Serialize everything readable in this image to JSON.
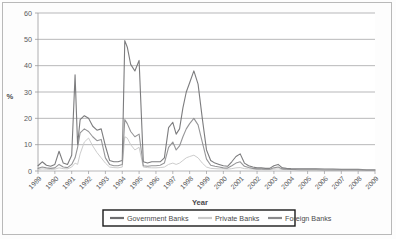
{
  "figure": {
    "kind": "line-chart-image",
    "background": "#fdfdfd",
    "frame_color": "#b9b9b9"
  },
  "axes": {
    "y_label": "%",
    "x_label": "Year",
    "y_ticks": [
      "0",
      "10",
      "20",
      "30",
      "40",
      "50",
      "60"
    ],
    "x_ticks": [
      "1989",
      "1990",
      "1991",
      "1992",
      "1993",
      "1994",
      "1995",
      "1996",
      "1997",
      "1998",
      "1999",
      "2000",
      "2001",
      "2002",
      "2003",
      "2004",
      "2005",
      "2006",
      "2007",
      "2008",
      "2009"
    ]
  },
  "legend": {
    "items": [
      {
        "label": "Government Banks",
        "color": "#6e6e70"
      },
      {
        "label": "Private Banks",
        "color": "#c9c9c9"
      },
      {
        "label": "Foreign Banks",
        "color": "#8a8a8c"
      }
    ],
    "border_color": "#1a1a1a",
    "position": "bottom-center"
  },
  "chart_data": {
    "type": "line",
    "title": "",
    "subtitle": "",
    "xlabel": "Year",
    "ylabel": "%",
    "xlim": [
      1989,
      2009
    ],
    "ylim": [
      0,
      60
    ],
    "grid": "horizontal",
    "legend_position": "bottom-center",
    "x": [
      1989,
      1989.25,
      1989.5,
      1989.75,
      1990,
      1990.25,
      1990.5,
      1990.75,
      1991,
      1991.2,
      1991.35,
      1991.5,
      1991.75,
      1992,
      1992.25,
      1992.5,
      1992.75,
      1993,
      1993.25,
      1993.5,
      1993.75,
      1994,
      1994.15,
      1994.3,
      1994.5,
      1994.75,
      1995,
      1995.25,
      1995.5,
      1995.75,
      1996,
      1996.25,
      1996.5,
      1996.75,
      1997,
      1997.2,
      1997.4,
      1997.6,
      1997.8,
      1998,
      1998.25,
      1998.5,
      1998.75,
      1999,
      1999.25,
      1999.5,
      1999.75,
      2000,
      2000.25,
      2000.5,
      2000.75,
      2001,
      2001.25,
      2001.5,
      2001.75,
      2002,
      2002.25,
      2002.5,
      2002.75,
      2003,
      2003.25,
      2003.5,
      2003.75,
      2004,
      2004.5,
      2005,
      2005.5,
      2006,
      2006.5,
      2007,
      2007.5,
      2008,
      2008.5,
      2009
    ],
    "series": [
      {
        "name": "Government Banks",
        "color": "#6e6e70",
        "values": [
          2.0,
          3.5,
          2.2,
          1.8,
          2.5,
          7.5,
          3.0,
          2.5,
          6.0,
          36.5,
          10.0,
          19.5,
          21.0,
          20.0,
          17.0,
          15.5,
          16.0,
          9.5,
          4.0,
          3.5,
          3.5,
          4.0,
          49.5,
          47.0,
          40.5,
          38.0,
          42.0,
          3.5,
          3.0,
          3.5,
          3.5,
          3.5,
          5.0,
          16.5,
          18.5,
          14.0,
          16.0,
          24.0,
          30.0,
          33.5,
          38.0,
          33.0,
          20.0,
          8.0,
          4.0,
          3.0,
          2.5,
          2.0,
          1.8,
          3.5,
          5.5,
          6.5,
          3.0,
          2.0,
          1.5,
          1.2,
          1.2,
          1.0,
          1.0,
          2.0,
          2.5,
          1.2,
          1.0,
          0.9,
          0.8,
          0.8,
          0.8,
          0.7,
          0.7,
          0.6,
          0.6,
          0.6,
          0.5,
          0.5
        ]
      },
      {
        "name": "Private Banks",
        "color": "#c9c9c9",
        "values": [
          0.6,
          0.8,
          0.7,
          0.6,
          0.7,
          1.2,
          0.9,
          0.8,
          1.5,
          3.0,
          2.5,
          6.5,
          11.0,
          12.5,
          9.5,
          7.0,
          5.0,
          3.0,
          1.5,
          1.3,
          1.2,
          1.5,
          13.0,
          12.5,
          10.0,
          8.0,
          9.0,
          1.5,
          1.3,
          1.2,
          1.2,
          1.3,
          1.5,
          2.5,
          3.0,
          2.5,
          3.0,
          4.0,
          5.0,
          5.5,
          6.0,
          5.0,
          3.0,
          1.5,
          1.0,
          0.9,
          0.8,
          0.8,
          0.7,
          0.9,
          1.2,
          1.3,
          0.9,
          0.8,
          0.7,
          0.6,
          0.6,
          0.5,
          0.5,
          0.7,
          0.8,
          0.6,
          0.5,
          0.5,
          0.4,
          0.4,
          0.4,
          0.4,
          0.3,
          0.3,
          0.3,
          0.3,
          0.3,
          0.3
        ]
      },
      {
        "name": "Foreign Banks",
        "color": "#8a8a8c",
        "values": [
          1.0,
          1.5,
          1.2,
          1.0,
          1.2,
          2.5,
          1.5,
          1.3,
          2.5,
          5.0,
          9.0,
          14.5,
          16.0,
          15.0,
          13.0,
          11.5,
          12.0,
          5.0,
          2.5,
          2.0,
          2.0,
          2.5,
          19.5,
          18.0,
          15.0,
          13.0,
          14.0,
          2.0,
          1.8,
          2.0,
          2.0,
          2.2,
          3.0,
          9.0,
          11.0,
          8.0,
          9.5,
          13.0,
          16.0,
          18.0,
          20.0,
          17.5,
          11.0,
          4.5,
          2.2,
          1.8,
          1.5,
          1.2,
          1.1,
          2.0,
          3.0,
          3.5,
          1.8,
          1.3,
          1.0,
          0.8,
          0.8,
          0.7,
          0.7,
          1.2,
          1.5,
          0.8,
          0.7,
          0.6,
          0.5,
          0.5,
          0.5,
          0.4,
          0.4,
          0.4,
          0.4,
          0.4,
          0.3,
          0.3
        ]
      }
    ]
  }
}
